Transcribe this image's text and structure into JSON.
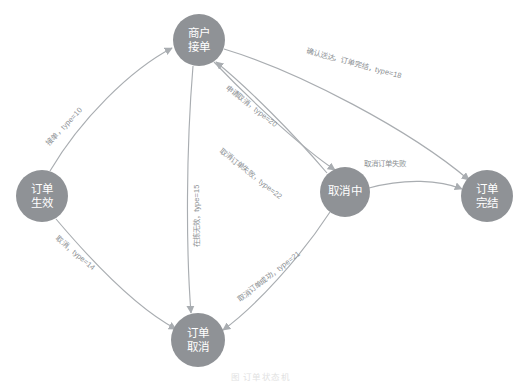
{
  "diagram": {
    "title": "订单状态机",
    "caption": "图 订单状态机",
    "colors": {
      "node_fill": "#8f9296",
      "node_text": "#ffffff",
      "edge_stroke": "#a9adb1",
      "edge_label_text": "#8b8f93",
      "background": "#ffffff"
    },
    "nodes": [
      {
        "id": "merchant_accept",
        "label_line1": "商户",
        "label_line2": "接单",
        "cx": 199,
        "cy": 40,
        "r": 26
      },
      {
        "id": "order_effective",
        "label_line1": "订单",
        "label_line2": "生效",
        "cx": 42,
        "cy": 196,
        "r": 26
      },
      {
        "id": "cancelling",
        "label_line1": "取消",
        "label_line2": "中",
        "cx": 345,
        "cy": 192,
        "r": 25
      },
      {
        "id": "order_finished",
        "label_line1": "订单",
        "label_line2": "完结",
        "cx": 487,
        "cy": 196,
        "r": 26
      },
      {
        "id": "order_cancelled",
        "label_line1": "订单",
        "label_line2": "取消",
        "cx": 198,
        "cy": 340,
        "r": 27
      }
    ],
    "edges": [
      {
        "id": "accept",
        "from": "order_effective",
        "to": "merchant_accept",
        "label": "接单，type=10",
        "label_x": 66,
        "label_y": 128,
        "label_rotate": -47
      },
      {
        "id": "cancel_from_effective",
        "from": "order_effective",
        "to": "order_cancelled",
        "label": "取消，type=14",
        "label_x": 74,
        "label_y": 255,
        "label_rotate": 40
      },
      {
        "id": "reject_invalid",
        "from": "merchant_accept",
        "to": "order_cancelled",
        "label": "在拣无效，type=15",
        "label_x": 199,
        "label_y": 216,
        "label_rotate": -90
      },
      {
        "id": "confirm_delivered",
        "from": "merchant_accept",
        "to": "order_finished",
        "label": "确认送达，订单完结，type=18",
        "label_x": 306,
        "label_y": 53,
        "label_rotate": 15
      },
      {
        "id": "apply_cancel",
        "from": "merchant_accept",
        "to": "cancelling",
        "label": "申请取消，type=20",
        "label_x": 250,
        "label_y": 108,
        "label_rotate": 38
      },
      {
        "id": "cancel_failed_back",
        "from": "cancelling",
        "to": "merchant_accept",
        "label": "取消订单失败，type=22",
        "label_x": 219,
        "label_y": 152,
        "label_rotate": 38
      },
      {
        "id": "cancel_success",
        "from": "cancelling",
        "to": "order_cancelled",
        "label": "取消订单成功，type=21",
        "label_x": 240,
        "label_y": 302,
        "label_rotate": -38
      },
      {
        "id": "cancel_failed_finish",
        "from": "cancelling",
        "to": "order_finished",
        "label": "取消订单失败",
        "label_x": 385,
        "label_y": 166,
        "label_rotate": 0
      }
    ]
  }
}
